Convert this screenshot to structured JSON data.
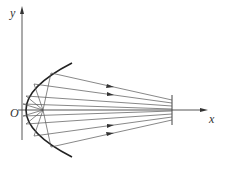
{
  "diagram": {
    "axis_labels": {
      "x": "x",
      "y": "y",
      "origin": "O"
    },
    "colors": {
      "line": "#444444",
      "curve": "#222222"
    }
  }
}
